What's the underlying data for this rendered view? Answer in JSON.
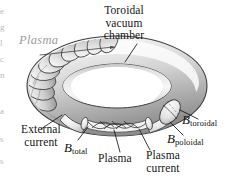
{
  "figure": {
    "title_label": "Toroidal\nvacuum\nchamber",
    "background_color": "#ffffff",
    "ink_color": "#161616"
  },
  "labels": {
    "toroidal_line1": "Toroidal",
    "toroidal_line2": "vacuum",
    "toroidal_line3": "chamber",
    "plasma_ghost": "Plasma",
    "external_line1": "External",
    "external_line2": "current",
    "b_total_sym": "B",
    "b_total_sub": "total",
    "b_toroidal_sym": "B",
    "b_toroidal_sub": "toroidal",
    "b_poloidal_sym": "B",
    "b_poloidal_sub": "poloidal",
    "plasma_bottom": "Plasma",
    "plasma_current_line1": "Plasma",
    "plasma_current_line2": "current"
  },
  "edge_fragments": {
    "items": [
      "e",
      "g",
      "l",
      "c",
      "n",
      "a",
      "s",
      "s"
    ]
  },
  "colors": {
    "tube_light": "#f4f4f4",
    "tube_mid": "#d7d7d7",
    "tube_dark": "#a8a8a8",
    "tube_outline": "#4a4a4a",
    "coil_fill": "#e3e3e3",
    "ghost_text": "#9c9c9c",
    "leader_line": "#1d1d1d"
  }
}
